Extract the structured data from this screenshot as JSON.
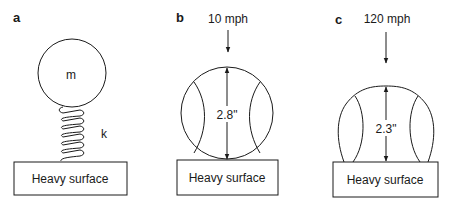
{
  "panels": [
    {
      "letter": "a",
      "mass_label": "m",
      "spring_label": "k",
      "surface_label": "Heavy surface"
    },
    {
      "letter": "b",
      "speed_label": "10 mph",
      "dimension_label": "2.8\"",
      "surface_label": "Heavy surface"
    },
    {
      "letter": "c",
      "speed_label": "120 mph",
      "dimension_label": "2.3\"",
      "surface_label": "Heavy surface"
    }
  ],
  "colors": {
    "line": "#1a1a1a",
    "background": "#ffffff"
  }
}
